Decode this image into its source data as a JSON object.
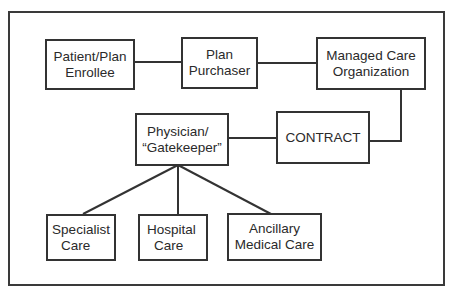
{
  "diagram": {
    "colors": {
      "stroke": "#333333",
      "text": "#2a2a2a",
      "background": "#ffffff"
    },
    "nodes": {
      "enrollee": {
        "line1": "Patient/Plan",
        "line2": "Enrollee"
      },
      "purchaser": {
        "line1": "Plan",
        "line2": "Purchaser"
      },
      "mco": {
        "line1": "Managed Care",
        "line2": "Organization"
      },
      "physician": {
        "line1": "Physician/",
        "line2": "“Gatekeeper”"
      },
      "contract": {
        "line1": "CONTRACT"
      },
      "specialist": {
        "line1": "Specialist",
        "line2": "Care"
      },
      "hospital": {
        "line1": "Hospital",
        "line2": "Care"
      },
      "ancillary": {
        "line1": "Ancillary",
        "line2": "Medical Care"
      }
    },
    "edges": [
      {
        "from": "Patient/Plan Enrollee",
        "to": "Plan Purchaser"
      },
      {
        "from": "Plan Purchaser",
        "to": "Managed Care Organization"
      },
      {
        "from": "Managed Care Organization",
        "to": "CONTRACT"
      },
      {
        "from": "CONTRACT",
        "to": "Physician/“Gatekeeper”"
      },
      {
        "from": "Physician/“Gatekeeper”",
        "to": "Specialist Care"
      },
      {
        "from": "Physician/“Gatekeeper”",
        "to": "Hospital Care"
      },
      {
        "from": "Physician/“Gatekeeper”",
        "to": "Ancillary Medical Care"
      }
    ]
  }
}
